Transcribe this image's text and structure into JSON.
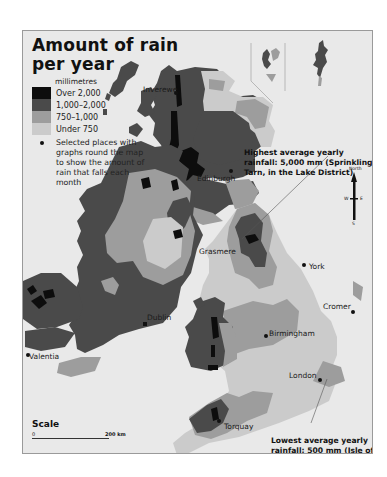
{
  "title": "Amount of rain per year",
  "title_lines": [
    "Amount of rain",
    "per year"
  ],
  "legend": {
    "unit": "millimetres",
    "classes": [
      {
        "label": "Over 2,000",
        "color": "#0d0d0d"
      },
      {
        "label": "1,000–2,000",
        "color": "#4a4a4a"
      },
      {
        "label": "750–1,000",
        "color": "#9d9d9d"
      },
      {
        "label": "Under 750",
        "color": "#cbcbcb"
      }
    ],
    "marker_label": "Selected places with graphs round the map to show the amount of rain that falls each month"
  },
  "places": [
    {
      "name": "Inverewe"
    },
    {
      "name": "Edinburgh"
    },
    {
      "name": "Grasmere"
    },
    {
      "name": "York"
    },
    {
      "name": "Dublin"
    },
    {
      "name": "Cromer"
    },
    {
      "name": "Birmingham"
    },
    {
      "name": "London"
    },
    {
      "name": "Valentia"
    },
    {
      "name": "Torquay"
    }
  ],
  "annotations": {
    "highest": "Highest average yearly rainfall: 5,000 mm (Sprinkling Tarn, in the Lake District)",
    "lowest": "Lowest average yearly rainfall: 500 mm (Isle of Grain)"
  },
  "compass": {
    "n": "North",
    "s": "S",
    "e": "E",
    "w": "W"
  },
  "scale": {
    "title": "Scale",
    "start": "0",
    "end": "200 km"
  },
  "colors": {
    "background": "#e9e9e9",
    "sea": "#e9e9e9",
    "frame": "#9a9a9a"
  }
}
